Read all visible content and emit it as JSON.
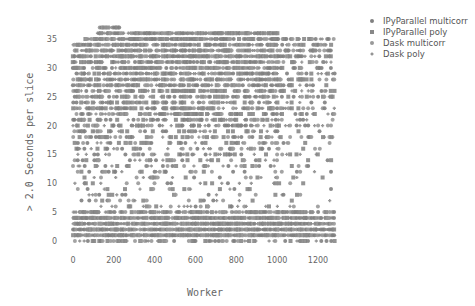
{
  "chart_data": {
    "type": "scatter",
    "title": "",
    "xlabel": "Worker",
    "ylabel": "> 2.0 Seconds per slice",
    "xlim": [
      -25,
      1300
    ],
    "ylim": [
      -1.5,
      38
    ],
    "xticks": [
      0,
      200,
      400,
      600,
      800,
      1000,
      1200
    ],
    "yticks": [
      0,
      5,
      10,
      15,
      20,
      25,
      30,
      35
    ],
    "grid": false,
    "legend_position": "right-top",
    "series": [
      {
        "name": "IPyParallel multicorr",
        "marker": "circle",
        "color": "#808080"
      },
      {
        "name": "IPyParallel poly",
        "marker": "square",
        "color": "#888888"
      },
      {
        "name": "Dask multicorr",
        "marker": "circle",
        "color": "#999999"
      },
      {
        "name": "Dask poly",
        "marker": "cross",
        "color": "#8c8c8c"
      }
    ],
    "worker_range": [
      0,
      1280
    ],
    "y_levels": "integer values 0 to 37",
    "density_by_y": [
      {
        "y": 0,
        "density": 0.45,
        "x_from": 0,
        "x_to": 1280
      },
      {
        "y": 1,
        "density": 0.97,
        "x_from": 0,
        "x_to": 1280
      },
      {
        "y": 2,
        "density": 0.97,
        "x_from": 0,
        "x_to": 1280
      },
      {
        "y": 3,
        "density": 0.97,
        "x_from": 0,
        "x_to": 1280
      },
      {
        "y": 4,
        "density": 0.95,
        "x_from": 0,
        "x_to": 1280
      },
      {
        "y": 5,
        "density": 0.75,
        "x_from": 0,
        "x_to": 1280
      },
      {
        "y": 6,
        "density": 0.25,
        "x_from": 0,
        "x_to": 1280
      },
      {
        "y": 7,
        "density": 0.15,
        "x_from": 0,
        "x_to": 1280
      },
      {
        "y": 8,
        "density": 0.14,
        "x_from": 0,
        "x_to": 1280
      },
      {
        "y": 9,
        "density": 0.13,
        "x_from": 0,
        "x_to": 1280
      },
      {
        "y": 10,
        "density": 0.14,
        "x_from": 0,
        "x_to": 1280
      },
      {
        "y": 11,
        "density": 0.16,
        "x_from": 0,
        "x_to": 1280
      },
      {
        "y": 12,
        "density": 0.2,
        "x_from": 0,
        "x_to": 1280
      },
      {
        "y": 13,
        "density": 0.22,
        "x_from": 0,
        "x_to": 1280
      },
      {
        "y": 14,
        "density": 0.24,
        "x_from": 0,
        "x_to": 1280
      },
      {
        "y": 15,
        "density": 0.26,
        "x_from": 0,
        "x_to": 1280
      },
      {
        "y": 16,
        "density": 0.28,
        "x_from": 0,
        "x_to": 1280
      },
      {
        "y": 17,
        "density": 0.3,
        "x_from": 0,
        "x_to": 1280
      },
      {
        "y": 18,
        "density": 0.33,
        "x_from": 0,
        "x_to": 1280
      },
      {
        "y": 19,
        "density": 0.36,
        "x_from": 0,
        "x_to": 1280
      },
      {
        "y": 20,
        "density": 0.4,
        "x_from": 0,
        "x_to": 1280
      },
      {
        "y": 21,
        "density": 0.45,
        "x_from": 0,
        "x_to": 1280
      },
      {
        "y": 22,
        "density": 0.48,
        "x_from": 0,
        "x_to": 1280
      },
      {
        "y": 23,
        "density": 0.5,
        "x_from": 0,
        "x_to": 1280
      },
      {
        "y": 24,
        "density": 0.55,
        "x_from": 0,
        "x_to": 1280
      },
      {
        "y": 25,
        "density": 0.6,
        "x_from": 0,
        "x_to": 1280
      },
      {
        "y": 26,
        "density": 0.62,
        "x_from": 0,
        "x_to": 1280
      },
      {
        "y": 27,
        "density": 0.65,
        "x_from": 0,
        "x_to": 1280
      },
      {
        "y": 28,
        "density": 0.68,
        "x_from": 0,
        "x_to": 1280
      },
      {
        "y": 29,
        "density": 0.7,
        "x_from": 0,
        "x_to": 1280
      },
      {
        "y": 30,
        "density": 0.72,
        "x_from": 0,
        "x_to": 1280
      },
      {
        "y": 31,
        "density": 0.75,
        "x_from": 0,
        "x_to": 1280
      },
      {
        "y": 32,
        "density": 0.78,
        "x_from": 0,
        "x_to": 1280
      },
      {
        "y": 33,
        "density": 0.8,
        "x_from": 0,
        "x_to": 1280
      },
      {
        "y": 34,
        "density": 0.82,
        "x_from": 0,
        "x_to": 1280
      },
      {
        "y": 35,
        "density": 0.85,
        "x_from": 60,
        "x_to": 1280
      },
      {
        "y": 36,
        "density": 0.85,
        "x_from": 120,
        "x_to": 1000
      },
      {
        "y": 37,
        "density": 0.9,
        "x_from": 130,
        "x_to": 230
      }
    ]
  },
  "legend": {
    "items": [
      {
        "label": "IPyParallel multicorr"
      },
      {
        "label": "IPyParallel poly"
      },
      {
        "label": "Dask multicorr"
      },
      {
        "label": "Dask poly"
      }
    ]
  },
  "axes": {
    "xlabel": "Worker",
    "ylabel": "> 2.0 Seconds per slice"
  }
}
